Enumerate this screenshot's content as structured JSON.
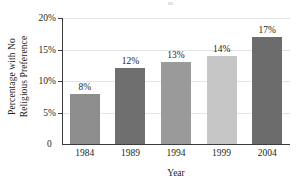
{
  "chart_data": {
    "type": "bar",
    "title": "",
    "xlabel": "Year",
    "ylabel": "Percentage with No Religious Preference",
    "ylabel_lines": [
      "Percentage with No",
      "Religious Preference"
    ],
    "categories": [
      "1984",
      "1989",
      "1994",
      "1999",
      "2004"
    ],
    "values": [
      8,
      12,
      13,
      14,
      17
    ],
    "value_labels": [
      "8%",
      "12%",
      "13%",
      "14%",
      "17%"
    ],
    "ylim": [
      0,
      20
    ],
    "ytick_values": [
      0,
      5,
      10,
      15,
      20
    ],
    "ytick_labels": [
      "0",
      "5%",
      "10%",
      "15%",
      "20%"
    ],
    "zero_label": "0",
    "grid": "horizontal",
    "legend": "none",
    "bar_colors": [
      "#8d8d8d",
      "#6f6f6f",
      "#9a9a9a",
      "#c6c6c6",
      "#6c6c6c"
    ],
    "axis_color": "#3b3b3b",
    "gridline_color": "#e3e3e3",
    "background": "#ffffff"
  }
}
